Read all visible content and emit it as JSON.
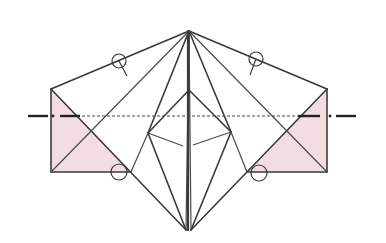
{
  "diagram": {
    "title": "",
    "colors": {
      "background": "#ffffff",
      "line": "#3a3a3a",
      "flap_fill": "#f2dde1",
      "fold_line": "#222222"
    },
    "markers": [
      {
        "id": "circle-top-left",
        "cx": 119,
        "cy": 61,
        "r": 7
      },
      {
        "id": "circle-top-right",
        "cx": 256,
        "cy": 59,
        "r": 7
      },
      {
        "id": "circle-bottom-left",
        "cx": 119,
        "cy": 172,
        "r": 8
      },
      {
        "id": "circle-bottom-right",
        "cx": 259,
        "cy": 173,
        "r": 8
      }
    ],
    "fold_line": {
      "type": "valley",
      "y": 116,
      "x_start": 28,
      "x_end": 356
    }
  }
}
